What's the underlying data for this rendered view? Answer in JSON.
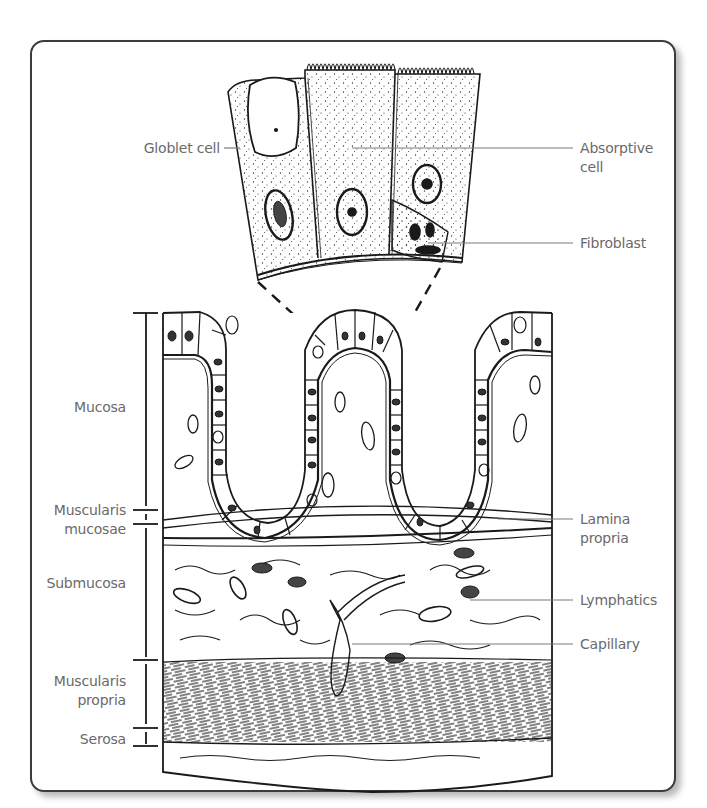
{
  "figure": {
    "colors": {
      "ink": "#1a1a1a",
      "label": "#6a6a6a",
      "leader": "#7a7a7a",
      "frame": "#3c3c3c",
      "background": "#ffffff"
    }
  },
  "labels": {
    "detail_left": [
      {
        "id": "goblet",
        "text": "Globlet cell"
      }
    ],
    "detail_right": [
      {
        "id": "absorptive",
        "lines": [
          "Absorptive",
          "cell"
        ]
      },
      {
        "id": "fibroblast",
        "text": "Fibroblast"
      }
    ],
    "layers_left": [
      {
        "id": "mucosa",
        "text": "Mucosa"
      },
      {
        "id": "muscularis-mucosae",
        "lines": [
          "Muscularis",
          "mucosae"
        ]
      },
      {
        "id": "submucosa",
        "text": "Submucosa"
      },
      {
        "id": "muscularis-propria",
        "lines": [
          "Muscularis",
          "propria"
        ]
      },
      {
        "id": "serosa",
        "text": "Serosa"
      }
    ],
    "structures_right": [
      {
        "id": "lamina-propria",
        "lines": [
          "Lamina",
          "propria"
        ]
      },
      {
        "id": "lymphatics",
        "text": "Lymphatics"
      },
      {
        "id": "capillary",
        "text": "Capillary"
      }
    ]
  }
}
